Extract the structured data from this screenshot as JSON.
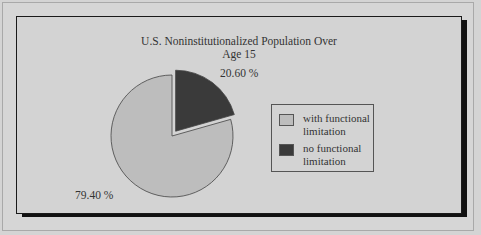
{
  "chart_data": {
    "type": "pie",
    "title": "U.S. Noninstitutionalized Population Over Age 15",
    "title_lines": [
      "U.S. Noninstitutionalized Population Over",
      "Age 15"
    ],
    "categories": [
      "with functional limitation",
      "no functional limitation"
    ],
    "values": [
      79.4,
      20.6
    ],
    "value_labels": [
      "79.40 %",
      "20.60 %"
    ],
    "colors": [
      "#bdbdbd",
      "#3a3a3a"
    ],
    "exploded": [
      false,
      true
    ],
    "legend_position": "right",
    "legend": [
      {
        "label_line1": "with functional",
        "label_line2": "limitation",
        "color": "#bdbdbd"
      },
      {
        "label_line1": "no functional",
        "label_line2": "limitation",
        "color": "#3a3a3a"
      }
    ]
  }
}
